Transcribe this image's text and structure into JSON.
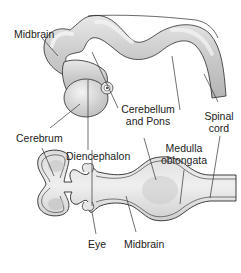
{
  "diagram": {
    "type": "anatomical illustration",
    "colors": {
      "tissue_fill": "#d6d6d6",
      "tissue_highlight": "#f2f2f2",
      "outline": "#2a2a2a",
      "leader_line": "#333333",
      "text": "#222222"
    }
  },
  "labels": {
    "midbrain_top": "Midbrain",
    "cerebellum_line1": "Cerebellum",
    "cerebellum_line2": "and Pons",
    "spinal_line1": "Spinal",
    "spinal_line2": "cord",
    "cerebrum": "Cerebrum",
    "diencephalon": "Diencephalon",
    "medulla_line1": "Medulla",
    "medulla_line2": "oblongata",
    "eye": "Eye",
    "midbrain_bottom": "Midbrain"
  }
}
